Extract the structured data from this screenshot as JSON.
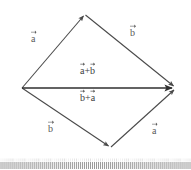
{
  "figure": {
    "type": "vector-addition-parallelogram",
    "caption_text": "",
    "background_color": "#ffffff",
    "stroke_color": "#4a4a4a",
    "main_stroke_color": "#2f2f2f",
    "label_color": "#5a5a5a"
  },
  "labels": {
    "upper_left": "a",
    "upper_right": "b",
    "center_upper": "a+b",
    "center_lower": "b+a",
    "lower_left": "b",
    "lower_right": "a"
  },
  "vertices": {
    "origin": {
      "x": 22,
      "y": 88
    },
    "top": {
      "x": 85,
      "y": 14
    },
    "right": {
      "x": 175,
      "y": 88
    },
    "bottom": {
      "x": 110,
      "y": 148
    }
  },
  "edges": [
    {
      "name": "origin-to-top",
      "label": "a",
      "from": "origin",
      "to": "top",
      "arrowhead": true
    },
    {
      "name": "top-to-right",
      "label": "b",
      "from": "top",
      "to": "right",
      "arrowhead": true
    },
    {
      "name": "origin-to-bottom",
      "label": "b",
      "from": "origin",
      "to": "bottom",
      "arrowhead": true
    },
    {
      "name": "bottom-to-right",
      "label": "a",
      "from": "bottom",
      "to": "right",
      "arrowhead": true
    },
    {
      "name": "origin-to-right-resultant",
      "label": "a+b",
      "from": "origin",
      "to": "right",
      "arrowhead": true
    }
  ],
  "ruler": {
    "name": "tick-strip",
    "tick_count": 96,
    "color": "#8c8c8c"
  }
}
